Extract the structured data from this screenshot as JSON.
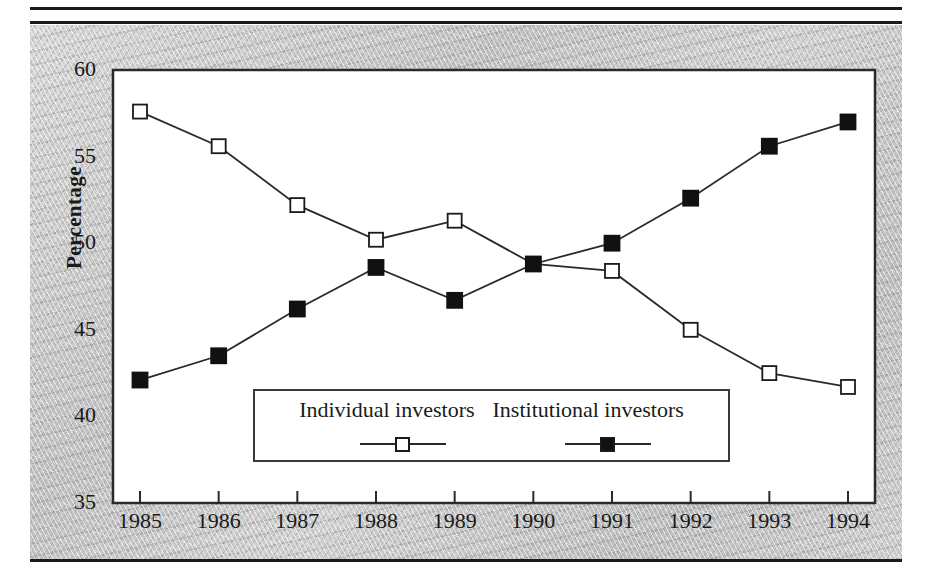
{
  "figure": {
    "background_color": "#c8c8c8",
    "plot_background_color": "#ffffff",
    "rule_color": "#1a1a1a"
  },
  "chart_data": {
    "type": "line",
    "title": "",
    "subtitle": "",
    "xlabel": "",
    "ylabel": "Percentage",
    "x": [
      1985,
      1986,
      1987,
      1988,
      1989,
      1990,
      1991,
      1992,
      1993,
      1994
    ],
    "categories": [
      "1985",
      "1986",
      "1987",
      "1988",
      "1989",
      "1990",
      "1991",
      "1992",
      "1993",
      "1994"
    ],
    "xtick_labels": [
      "1985",
      "1986",
      "1987",
      "1988",
      "1989",
      "1990",
      "1991",
      "1992",
      "1993",
      "1994"
    ],
    "ytick_labels": [
      "35",
      "40",
      "45",
      "50",
      "55",
      "60"
    ],
    "yticks": [
      35,
      40,
      45,
      50,
      55,
      60
    ],
    "ylim": [
      35,
      60
    ],
    "xlim": [
      1985,
      1994
    ],
    "grid": false,
    "legend_position": "inside-bottom-center",
    "series": [
      {
        "name": "Individual investors",
        "marker": "open-square",
        "marker_fill": "#ffffff",
        "marker_edge": "#1a1a1a",
        "line_color": "#2a2a2a",
        "values": [
          57.6,
          55.6,
          52.2,
          50.2,
          51.3,
          48.8,
          48.4,
          45.0,
          42.5,
          41.7
        ]
      },
      {
        "name": "Institutional investors",
        "marker": "filled-square",
        "marker_fill": "#111111",
        "marker_edge": "#111111",
        "line_color": "#2a2a2a",
        "values": [
          42.1,
          43.5,
          46.2,
          48.6,
          46.7,
          48.8,
          50.0,
          52.6,
          55.6,
          57.0
        ]
      }
    ],
    "legend": [
      {
        "label": "Individual investors",
        "marker": "open-square"
      },
      {
        "label": "Institutional investors",
        "marker": "filled-square"
      }
    ]
  }
}
